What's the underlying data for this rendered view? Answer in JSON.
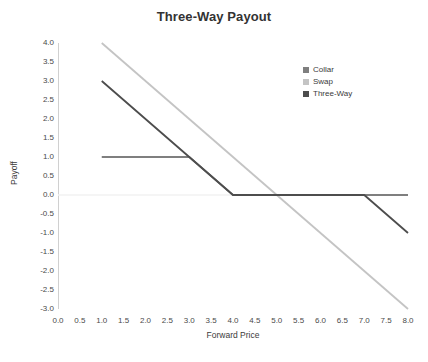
{
  "chart_data": {
    "type": "line",
    "title": "Three-Way Payout",
    "xlabel": "Forward Price",
    "ylabel": "Payoff",
    "xlim": [
      0.0,
      8.0
    ],
    "ylim": [
      -3.0,
      4.0
    ],
    "xticks": [
      "0.0",
      "0.5",
      "1.0",
      "1.5",
      "2.0",
      "2.5",
      "3.0",
      "3.5",
      "4.0",
      "4.5",
      "5.0",
      "5.5",
      "6.0",
      "6.5",
      "7.0",
      "7.5",
      "8.0"
    ],
    "xtick_values": [
      0.0,
      0.5,
      1.0,
      1.5,
      2.0,
      2.5,
      3.0,
      3.5,
      4.0,
      4.5,
      5.0,
      5.5,
      6.0,
      6.5,
      7.0,
      7.5,
      8.0
    ],
    "yticks": [
      "4.0",
      "3.5",
      "3.0",
      "2.5",
      "2.0",
      "1.5",
      "1.0",
      "0.5",
      "0.0",
      "-0.5",
      "-1.0",
      "-1.5",
      "-2.0",
      "-2.5",
      "-3.0"
    ],
    "ytick_values": [
      4.0,
      3.5,
      3.0,
      2.5,
      2.0,
      1.5,
      1.0,
      0.5,
      0.0,
      -0.5,
      -1.0,
      -1.5,
      -2.0,
      -2.5,
      -3.0
    ],
    "grid": false,
    "zero_line": true,
    "legend_position": "top-right",
    "series": [
      {
        "name": "Collar",
        "color": "#7f7f7f",
        "x": [
          1.0,
          3.0,
          4.0,
          8.0
        ],
        "values": [
          1.0,
          1.0,
          0.0,
          0.0
        ]
      },
      {
        "name": "Swap",
        "color": "#c4c4c4",
        "x": [
          1.0,
          8.0
        ],
        "values": [
          4.0,
          -3.0
        ]
      },
      {
        "name": "Three-Way",
        "color": "#4d4d4d",
        "x": [
          1.0,
          4.0,
          7.0,
          8.0
        ],
        "values": [
          3.0,
          0.0,
          0.0,
          -1.0
        ]
      }
    ]
  },
  "colors": {
    "axis": "#d0d0d0",
    "zero_line": "#f2f2f2",
    "text": "#3b3b3b",
    "title": "#333333"
  }
}
